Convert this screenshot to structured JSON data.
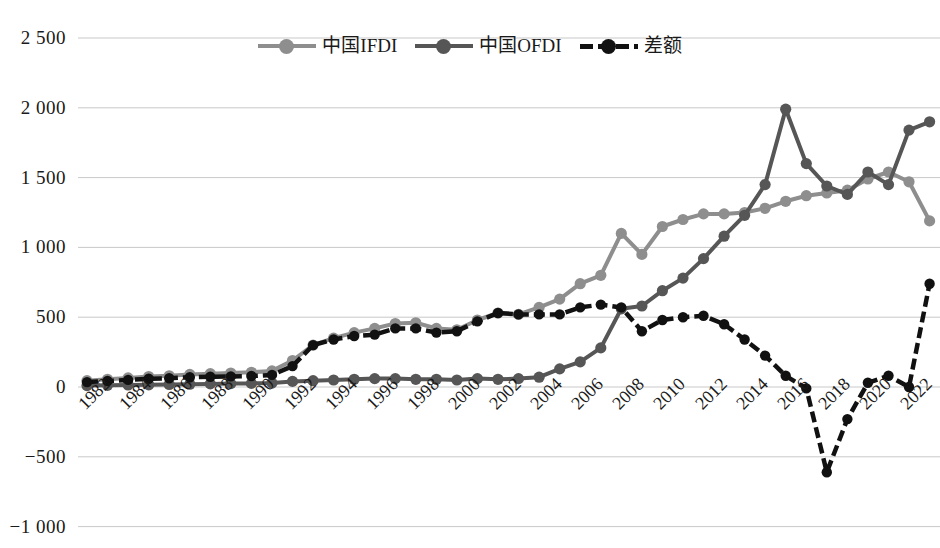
{
  "chart_data": {
    "type": "line",
    "title": "",
    "subtitle": "",
    "xlabel": "",
    "ylabel": "",
    "ylim": [
      -1000,
      2500
    ],
    "ytick_values": [
      2500,
      2000,
      1500,
      1000,
      500,
      0,
      -500,
      -1000
    ],
    "ytick_labels": [
      "2 500",
      "2 000",
      "1 500",
      "1 000",
      "500",
      "0",
      "−500",
      "−1 000"
    ],
    "xlim": [
      1982,
      2023
    ],
    "xtick_labels": [
      "1982",
      "1984",
      "1986",
      "1988",
      "1990",
      "1992",
      "1994",
      "1996",
      "1998",
      "2000",
      "2002",
      "2004",
      "2006",
      "2008",
      "2010",
      "2012",
      "2014",
      "2016",
      "2018",
      "2020",
      "2022"
    ],
    "grid": "horizontal",
    "legend_position": "top-center",
    "x": [
      1982,
      1983,
      1984,
      1985,
      1986,
      1987,
      1988,
      1989,
      1990,
      1991,
      1992,
      1993,
      1994,
      1995,
      1996,
      1997,
      1998,
      1999,
      2000,
      2001,
      2002,
      2003,
      2004,
      2005,
      2006,
      2007,
      2008,
      2009,
      2010,
      2011,
      2012,
      2013,
      2014,
      2015,
      2016,
      2017,
      2018,
      2019,
      2020,
      2021,
      2022,
      2023
    ],
    "series": [
      {
        "name": "中国IFDI",
        "color": "#8e8e8e",
        "marker": "circle",
        "dash": false,
        "values": [
          45,
          55,
          65,
          75,
          80,
          90,
          95,
          100,
          105,
          115,
          190,
          300,
          350,
          390,
          420,
          455,
          460,
          420,
          410,
          480,
          530,
          520,
          570,
          630,
          740,
          800,
          1100,
          950,
          1150,
          1200,
          1240,
          1240,
          1250,
          1280,
          1330,
          1370,
          1390,
          1410,
          1490,
          1540,
          1470,
          1190
        ]
      },
      {
        "name": "中国OFDI",
        "color": "#565656",
        "marker": "circle",
        "dash": false,
        "values": [
          10,
          12,
          14,
          16,
          18,
          20,
          22,
          24,
          26,
          28,
          40,
          45,
          50,
          55,
          60,
          60,
          55,
          55,
          50,
          60,
          55,
          60,
          70,
          130,
          180,
          280,
          560,
          580,
          690,
          780,
          920,
          1080,
          1230,
          1450,
          1990,
          1600,
          1440,
          1380,
          1540,
          1450,
          1840,
          1900
        ]
      },
      {
        "name": "差额",
        "color": "#111111",
        "marker": "circle",
        "dash": true,
        "values": [
          35,
          43,
          51,
          59,
          62,
          70,
          73,
          76,
          79,
          87,
          150,
          300,
          340,
          365,
          375,
          420,
          420,
          390,
          400,
          470,
          530,
          520,
          520,
          520,
          570,
          590,
          570,
          400,
          480,
          500,
          510,
          450,
          340,
          225,
          80,
          -10,
          -610,
          -230,
          30,
          80,
          0,
          740
        ]
      }
    ]
  },
  "legend": {
    "entries": [
      {
        "label": "中国IFDI",
        "color": "#8e8e8e",
        "dashed": false
      },
      {
        "label": "中国OFDI",
        "color": "#565656",
        "dashed": false
      },
      {
        "label": "差额",
        "color": "#111111",
        "dashed": true
      }
    ]
  },
  "axis": {
    "grid_color": "#c9c9c9",
    "plot_left": 78,
    "plot_right": 940
  }
}
